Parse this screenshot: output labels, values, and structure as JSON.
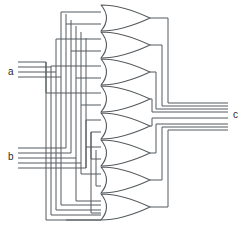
{
  "diagram": {
    "kind": "logic-gate-schematic",
    "background_color": "#ffffff",
    "wire_color": "#555a5e",
    "gate_fill_color": "#ffffff",
    "label_color": "#2b2b2b",
    "width": 245,
    "height": 233
  },
  "ports": {
    "input_a": {
      "label": "a",
      "x": 8,
      "y": 75,
      "bus_lines": 4,
      "bus_top": 62,
      "bus_spacing": 5,
      "bus_x_start": 18,
      "corner_x_start": 46,
      "corner_spacing": 5
    },
    "input_b": {
      "label": "b",
      "x": 8,
      "y": 160,
      "bus_lines": 5,
      "bus_top": 148,
      "bus_spacing": 5,
      "bus_x_start": 18,
      "corner_x_start": 50,
      "corner_spacing": 5
    },
    "output_c": {
      "label": "c",
      "x": 233,
      "y": 118,
      "bus_lines": 4,
      "bus_top": 105,
      "bus_spacing": 6,
      "bus_x_end": 228
    }
  },
  "gates": [
    {
      "id": "or-gate-1",
      "type": "OR",
      "index": 1,
      "cx": 106,
      "cy": 18,
      "width": 44,
      "height": 26,
      "output_turn_x": 168,
      "inputs": 2
    },
    {
      "id": "or-gate-2",
      "type": "OR",
      "index": 2,
      "cx": 106,
      "cy": 45,
      "width": 44,
      "height": 26,
      "output_turn_x": 162,
      "inputs": 2
    },
    {
      "id": "or-gate-3",
      "type": "OR",
      "index": 3,
      "cx": 106,
      "cy": 72,
      "width": 44,
      "height": 26,
      "output_turn_x": 156,
      "inputs": 2
    },
    {
      "id": "or-gate-4",
      "type": "OR",
      "index": 4,
      "cx": 106,
      "cy": 99,
      "width": 44,
      "height": 26,
      "output_turn_x": 150,
      "inputs": 2
    },
    {
      "id": "or-gate-5",
      "type": "OR",
      "index": 5,
      "cx": 106,
      "cy": 126,
      "width": 44,
      "height": 26,
      "output_turn_x": 150,
      "inputs": 2
    },
    {
      "id": "or-gate-6",
      "type": "OR",
      "index": 6,
      "cx": 106,
      "cy": 153,
      "width": 44,
      "height": 26,
      "output_turn_x": 156,
      "inputs": 2
    },
    {
      "id": "or-gate-7",
      "type": "OR",
      "index": 7,
      "cx": 106,
      "cy": 180,
      "width": 44,
      "height": 26,
      "output_turn_x": 162,
      "inputs": 2
    },
    {
      "id": "or-gate-8",
      "type": "OR",
      "index": 8,
      "cx": 106,
      "cy": 207,
      "width": 44,
      "height": 26,
      "output_turn_x": 168,
      "inputs": 2
    }
  ],
  "routing": {
    "left_trunk_xs": [
      46,
      51,
      56,
      61,
      66,
      71,
      76,
      81,
      86,
      91
    ],
    "top_feeder_ys": [
      12,
      24,
      36,
      48,
      60,
      72,
      84
    ],
    "bottom_feeder_ys": [
      150,
      162,
      174,
      186,
      198,
      210,
      222
    ],
    "gate_input_offset": 6,
    "note": "Each OR gate receives one line from the a-bus and one from the b-bus routed through vertical trunk wires."
  }
}
